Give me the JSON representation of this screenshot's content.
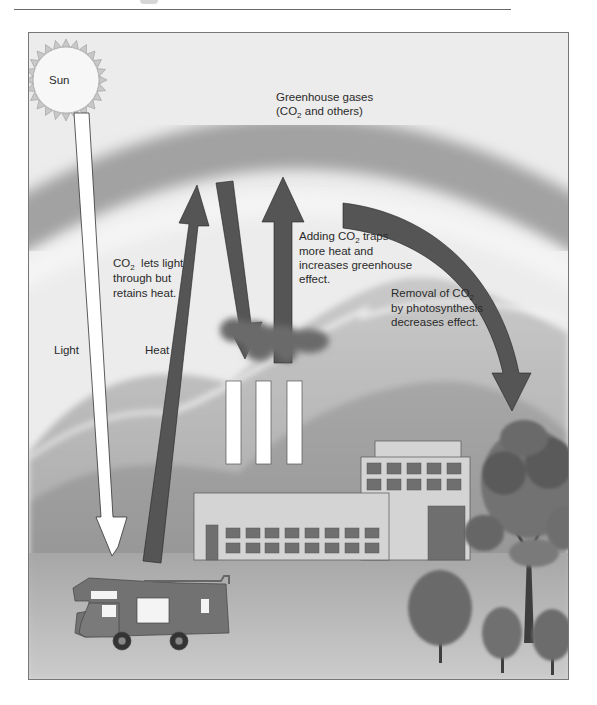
{
  "figure": {
    "colors": {
      "sky_light": "#ececec",
      "greenhouse_band": "#9a9a9a",
      "hills_mid": "#a8a8a8",
      "hills_dark": "#8a8a8a",
      "ground": "#bdbdbd",
      "arrow_dark": "#555555",
      "arrow_light": "#ffffff",
      "building": "#d4d4d4",
      "window": "#6f6f6f",
      "smoke": "#6a6a6a"
    }
  },
  "labels": {
    "sun": "Sun",
    "greenhouse_line1": "Greenhouse gases",
    "greenhouse_line2_pre": "(CO",
    "greenhouse_line2_sub": "2",
    "greenhouse_line2_post": " and others)",
    "light": "Light",
    "heat": "Heat",
    "co2_light_line1_pre": "CO",
    "co2_light_line1_sub": "2",
    "co2_light_line1_post": "  lets light",
    "co2_light_line2": "through but",
    "co2_light_line3": "retains heat.",
    "adding_line1_pre": "Adding CO",
    "adding_line1_sub": "2",
    "adding_line1_post": " traps",
    "adding_line2": "more heat and",
    "adding_line3": "increases greenhouse",
    "adding_line4": "effect.",
    "removal_line1_pre": "Removal of CO",
    "removal_line1_sub": "2",
    "removal_line2": "by photosynthesis",
    "removal_line3": "decreases effect."
  },
  "elements": {
    "arrows": [
      {
        "name": "light-arrow",
        "direction": "down",
        "from": "sun",
        "to": "ground"
      },
      {
        "name": "heat-arrow",
        "direction": "up",
        "from": "ground",
        "to": "greenhouse-gases"
      },
      {
        "name": "reflected-heat-arrow",
        "direction": "down",
        "from": "greenhouse-gases",
        "to": "factory"
      },
      {
        "name": "co2-emission-arrow",
        "direction": "up",
        "from": "factory",
        "to": "greenhouse-gases"
      },
      {
        "name": "co2-removal-arrow",
        "direction": "down-curved",
        "from": "greenhouse-gases",
        "to": "tree"
      }
    ],
    "factory": {
      "smokestacks": 3,
      "upper_windows": 10,
      "lower_windows": 16
    },
    "trees": 4,
    "vehicle": "motorhome"
  }
}
